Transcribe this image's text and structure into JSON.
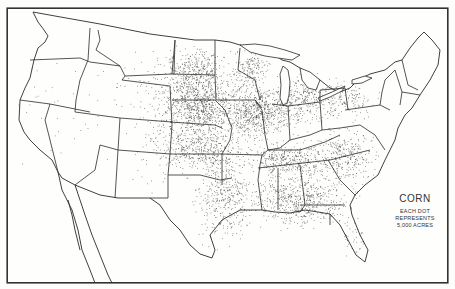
{
  "map": {
    "title": "CORN",
    "legend": {
      "title": "CORN",
      "lines": [
        "EACH DOT",
        "REPRESENTS",
        "5,000 ACRES"
      ]
    },
    "type": "dot-density",
    "region": "United States",
    "dot_value_acres": 5000,
    "colors": {
      "ink": "#2a2a2a",
      "dot": "#3a3a3a",
      "paper": "#fefefc"
    },
    "density_regions": [
      {
        "name": "Iowa-Nebraska core",
        "cx": 200,
        "cy": 105,
        "rx": 30,
        "ry": 28,
        "count": 900
      },
      {
        "name": "Illinois-Indiana core",
        "cx": 258,
        "cy": 112,
        "rx": 30,
        "ry": 22,
        "count": 700
      },
      {
        "name": "Minnesota-South Dakota",
        "cx": 195,
        "cy": 70,
        "rx": 25,
        "ry": 20,
        "count": 300
      },
      {
        "name": "Ohio-Michigan",
        "cx": 300,
        "cy": 100,
        "rx": 25,
        "ry": 22,
        "count": 300
      },
      {
        "name": "Kansas-Missouri",
        "cx": 205,
        "cy": 150,
        "rx": 38,
        "ry": 18,
        "count": 450
      },
      {
        "name": "Wisconsin",
        "cx": 250,
        "cy": 70,
        "rx": 16,
        "ry": 16,
        "count": 180
      },
      {
        "name": "Kentucky-Tennessee",
        "cx": 290,
        "cy": 160,
        "rx": 35,
        "ry": 14,
        "count": 380
      },
      {
        "name": "Deep South",
        "cx": 300,
        "cy": 200,
        "rx": 45,
        "ry": 22,
        "count": 600
      },
      {
        "name": "Carolinas-Virginia",
        "cx": 345,
        "cy": 155,
        "rx": 25,
        "ry": 22,
        "count": 300
      },
      {
        "name": "Texas-Oklahoma",
        "cx": 225,
        "cy": 200,
        "rx": 25,
        "ry": 40,
        "count": 400
      },
      {
        "name": "Pennsylvania-New York",
        "cx": 345,
        "cy": 100,
        "rx": 28,
        "ry": 15,
        "count": 160
      },
      {
        "name": "Great Plains sparse",
        "cx": 160,
        "cy": 110,
        "rx": 30,
        "ry": 60,
        "count": 160
      },
      {
        "name": "Mountain West sparse",
        "cx": 115,
        "cy": 110,
        "rx": 55,
        "ry": 55,
        "count": 45
      },
      {
        "name": "Pacific sparse",
        "cx": 45,
        "cy": 110,
        "rx": 20,
        "ry": 55,
        "count": 18
      },
      {
        "name": "Florida",
        "cx": 355,
        "cy": 235,
        "rx": 10,
        "ry": 18,
        "count": 40
      }
    ]
  }
}
